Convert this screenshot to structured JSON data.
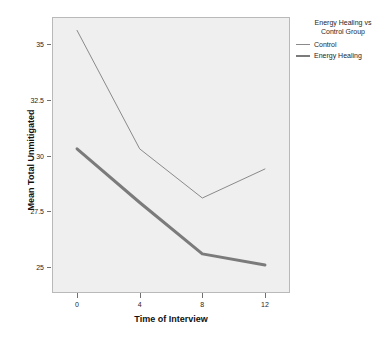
{
  "chart_data": {
    "type": "line",
    "title": "",
    "subtitle": "",
    "xlabel": "Time of Interview",
    "ylabel": "Mean Total Unmitigated",
    "x": [
      0,
      4,
      8,
      12
    ],
    "categories": [
      "0",
      "4",
      "8",
      "12"
    ],
    "xtick_labels": [
      "0",
      "4",
      "8",
      "12"
    ],
    "ytick_labels": [
      "25",
      "27.5",
      "30",
      "32.5",
      "35"
    ],
    "ytick_values": [
      25,
      27.5,
      30,
      32.5,
      35
    ],
    "xlim": [
      -1.6,
      13.6
    ],
    "ylim": [
      23.85,
      36.2
    ],
    "grid": false,
    "legend_position": "right",
    "legend_title": "Energy Healing vs Control Group",
    "legend_title_line1": "Energy Healing vs",
    "legend_title_line2": "Control Group",
    "series": [
      {
        "name": "Control",
        "values": [
          35.6,
          30.3,
          28.1,
          29.4
        ],
        "color": "#8a8a8a",
        "line_width": 1,
        "style": "thin"
      },
      {
        "name": "Energy Healing",
        "values": [
          30.3,
          27.9,
          25.6,
          25.1
        ],
        "color": "#7b7b7b",
        "line_width": 3,
        "style": "thick"
      }
    ]
  },
  "colors": {
    "plot_background": "#efefef",
    "figure_background": "#ffffff",
    "frame_border": "#b9b9b9",
    "axis_text": "#262626",
    "axis_title": "#111111"
  }
}
